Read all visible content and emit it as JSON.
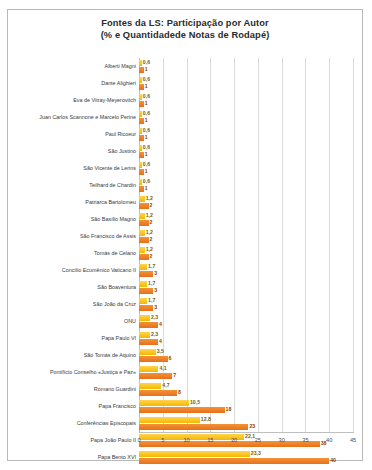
{
  "chart_title_line1": "Fontes da LS: Participação  por Autor",
  "chart_title_line2": "(% e Quantidadede Notas de Rodapé)",
  "colors": {
    "pct": "#F5B800",
    "notes": "#E8701A",
    "grid": "#D9D9D9",
    "axis": "#BFBFBF",
    "border": "#B9B9B9",
    "text": "#3A3A3A"
  },
  "legend": {
    "position": "bottom",
    "items": [
      {
        "label": "% de Participação",
        "color": "#F5B800"
      },
      {
        "label": "Notas de Rodapé",
        "color": "#E8701A"
      }
    ]
  },
  "axis": {
    "ticks": [
      "0",
      "5",
      "10",
      "15",
      "20",
      "25",
      "30",
      "35",
      "40",
      "45"
    ],
    "min": 0,
    "max": 45
  },
  "chart_data": {
    "type": "bar",
    "orientation": "horizontal",
    "title": "Fontes da LS: Participação por Autor (% e Quantidadede Notas de Rodapé)",
    "xlabel": "",
    "ylabel": "",
    "xlim": [
      0,
      45
    ],
    "grid": true,
    "legend_position": "bottom",
    "categories": [
      "Alberti Magni",
      "Dante Alighieri",
      "Eva de Vitray-Meyerovitch",
      "Juan Carlos Scannone e Marcelo Perine",
      "Paul Ricoeur",
      "São Justino",
      "São Vicente de Lerins",
      "Teilhard de Chardin",
      "Patriarca Bartolomeu",
      "São Basílio Magno",
      "São Francisco de Assis",
      "Tomás de Celano",
      "Concílio Ecumênico Vaticano II",
      "São Boaventura",
      "São João da Cruz",
      "ONU",
      "Papa Paulo VI",
      "São Tomás de Aquino",
      "Pontifício Conselho «Justiça e Paz»",
      "Romano Guardini",
      "Papa Francisco",
      "Conferências Episcopais",
      "Papa João Paulo II",
      "Papa Bento XVI"
    ],
    "series": [
      {
        "name": "% de Participação",
        "color": "#F5B800",
        "values": [
          0.6,
          0.6,
          0.6,
          0.6,
          0.6,
          0.6,
          0.6,
          0.6,
          1.2,
          1.2,
          1.2,
          1.2,
          1.7,
          1.7,
          1.7,
          2.3,
          2.3,
          3.5,
          4.1,
          4.7,
          10.5,
          12.8,
          22.1,
          23.3
        ],
        "labels": [
          "0,6",
          "0,6",
          "0,6",
          "0,6",
          "0,6",
          "0,6",
          "0,6",
          "0,6",
          "1,2",
          "1,2",
          "1,2",
          "1,2",
          "1,7",
          "1,7",
          "1,7",
          "2,3",
          "2,3",
          "3,5",
          "4,1",
          "4,7",
          "10,5",
          "12,8",
          "22,1",
          "23,3"
        ]
      },
      {
        "name": "Notas de Rodapé",
        "color": "#E8701A",
        "values": [
          1,
          1,
          1,
          1,
          1,
          1,
          1,
          1,
          2,
          2,
          2,
          2,
          3,
          3,
          3,
          4,
          4,
          6,
          7,
          8,
          18,
          23,
          38,
          40
        ],
        "labels": [
          "1",
          "1",
          "1",
          "1",
          "1",
          "1",
          "1",
          "1",
          "2",
          "2",
          "2",
          "2",
          "3",
          "3",
          "3",
          "4",
          "4",
          "6",
          "7",
          "8",
          "18",
          "23",
          "38",
          "40"
        ]
      }
    ]
  }
}
